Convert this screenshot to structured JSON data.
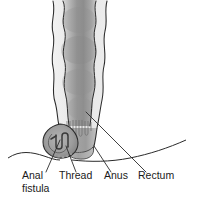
{
  "figure": {
    "background_color": "#ffffff",
    "width": 197,
    "height": 199,
    "line_color": "#2b2b2b",
    "tissue_light": "#e9e9e9",
    "tissue_mid": "#b5b5b5",
    "tissue_dark": "#8c8c8c",
    "lumen_shadow": "#9a9a9a",
    "thread_color": "#3a3a3a"
  },
  "labels": [
    {
      "id": "anal-fistula",
      "line1": "Anal",
      "line2": "fistula",
      "x": 22,
      "y1": 179,
      "y2": 192
    },
    {
      "id": "thread",
      "line1": "Thread",
      "line2": "",
      "x": 59,
      "y1": 179,
      "y2": 192
    },
    {
      "id": "anus",
      "line1": "Anus",
      "line2": "",
      "x": 104,
      "y1": 179,
      "y2": 192
    },
    {
      "id": "rectum",
      "line1": "Rectum",
      "line2": "",
      "x": 138,
      "y1": 179,
      "y2": 192
    }
  ],
  "leaders": [
    {
      "id": "leader-anal-fistula",
      "path": "M 46 172 L 60 140"
    },
    {
      "id": "leader-thread",
      "path": "M 76 172 L 66 146"
    },
    {
      "id": "leader-anus",
      "path": "M 111 172 L 94 146"
    },
    {
      "id": "leader-rectum",
      "path": "M 146 172 L 86 112"
    }
  ],
  "anatomy": {
    "rectum_label": "rectum-wall",
    "lumen_label": "rectal-lumen",
    "anal_canal_label": "anal-canal",
    "sphincter_label": "anal-sphincter",
    "fistula_label": "fistula-tract",
    "seton_label": "seton-thread-loop",
    "skin_label": "perianal-skin-line"
  }
}
